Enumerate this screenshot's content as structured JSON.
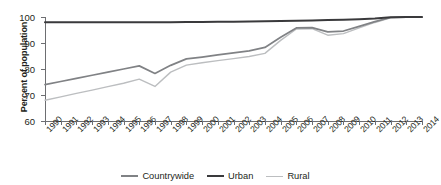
{
  "chart_data": {
    "type": "line",
    "title": "",
    "xlabel": "",
    "ylabel": "Percent of population",
    "ylim": [
      60,
      100
    ],
    "yticks": [
      60,
      70,
      80,
      90,
      100
    ],
    "grid": false,
    "legend_position": "bottom",
    "x": [
      1990,
      1991,
      1992,
      1993,
      1994,
      1995,
      1996,
      1997,
      1998,
      1999,
      2000,
      2001,
      2002,
      2003,
      2004,
      2005,
      2006,
      2007,
      2008,
      2009,
      2010,
      2011,
      2012,
      2013,
      2014
    ],
    "categories": [
      "1990",
      "1991",
      "1992",
      "1993",
      "1994",
      "1995",
      "1996",
      "1997",
      "1998",
      "1999",
      "2000",
      "2001",
      "2002",
      "2003",
      "2004",
      "2005",
      "2006",
      "2007",
      "2008",
      "2009",
      "2010",
      "2011",
      "2012",
      "2013",
      "2014"
    ],
    "series": [
      {
        "name": "Countrywide",
        "color": "#808285",
        "values": [
          74.0,
          75.2,
          76.4,
          77.6,
          78.8,
          80.0,
          81.2,
          78.3,
          81.4,
          83.9,
          84.6,
          85.4,
          86.2,
          87.0,
          88.3,
          92.2,
          95.8,
          95.9,
          94.3,
          94.6,
          96.4,
          98.2,
          99.8,
          99.9,
          99.9
        ]
      },
      {
        "name": "Urban",
        "color": "#3a3a3c",
        "values": [
          98.0,
          98.0,
          98.0,
          98.0,
          98.0,
          98.0,
          98.0,
          98.0,
          98.0,
          98.1,
          98.1,
          98.2,
          98.2,
          98.3,
          98.4,
          98.5,
          98.6,
          98.7,
          98.8,
          98.9,
          99.1,
          99.4,
          99.9,
          100.0,
          100.0
        ]
      },
      {
        "name": "Rural",
        "color": "#bcbec0",
        "values": [
          68.0,
          69.3,
          70.6,
          71.9,
          73.2,
          74.5,
          76.1,
          73.3,
          78.8,
          81.5,
          82.4,
          83.2,
          84.0,
          84.8,
          86.0,
          91.0,
          95.4,
          95.5,
          93.0,
          93.6,
          95.8,
          97.9,
          99.7,
          99.9,
          99.9
        ]
      }
    ]
  },
  "legend": {
    "items": [
      {
        "label": "Countrywide"
      },
      {
        "label": "Urban"
      },
      {
        "label": "Rural"
      }
    ]
  }
}
